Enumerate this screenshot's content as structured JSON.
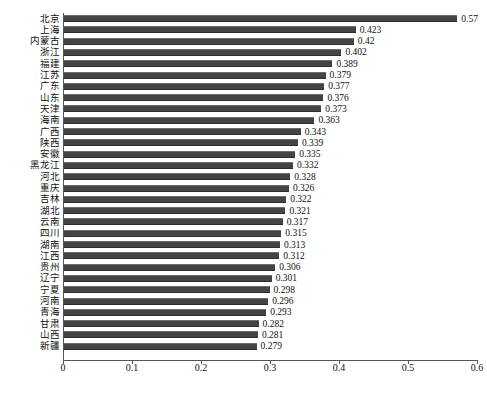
{
  "chart_data": {
    "type": "bar",
    "orientation": "horizontal",
    "title": "",
    "subtitle": "",
    "xlabel": "",
    "ylabel": "",
    "xlim": [
      0,
      0.6
    ],
    "xticks": [
      "0",
      "0.1",
      "0.2",
      "0.3",
      "0.4",
      "0.5",
      "0.6"
    ],
    "xtick_values": [
      0,
      0.1,
      0.2,
      0.3,
      0.4,
      0.5,
      0.6
    ],
    "grid": false,
    "legend": false,
    "bar_color": "#444444",
    "categories": [
      "北京",
      "上海",
      "内蒙古",
      "浙江",
      "福建",
      "江苏",
      "广东",
      "山东",
      "天津",
      "海南",
      "广西",
      "陕西",
      "安徽",
      "黑龙江",
      "河北",
      "重庆",
      "吉林",
      "湖北",
      "云南",
      "四川",
      "湖南",
      "江西",
      "贵州",
      "辽宁",
      "宁夏",
      "河南",
      "青海",
      "甘肃",
      "山西",
      "新疆"
    ],
    "values": [
      0.57,
      0.423,
      0.42,
      0.402,
      0.389,
      0.379,
      0.377,
      0.376,
      0.373,
      0.363,
      0.343,
      0.339,
      0.335,
      0.332,
      0.328,
      0.326,
      0.322,
      0.321,
      0.317,
      0.315,
      0.313,
      0.312,
      0.306,
      0.301,
      0.298,
      0.296,
      0.293,
      0.282,
      0.281,
      0.279
    ],
    "value_labels": [
      "0.57",
      "0.423",
      "0.42",
      "0.402",
      "0.389",
      "0.379",
      "0.377",
      "0.376",
      "0.373",
      "0.363",
      "0.343",
      "0.339",
      "0.335",
      "0.332",
      "0.328",
      "0.326",
      "0.322",
      "0.321",
      "0.317",
      "0.315",
      "0.313",
      "0.312",
      "0.306",
      "0.301",
      "0.298",
      "0.296",
      "0.293",
      "0.282",
      "0.281",
      "0.279"
    ]
  }
}
